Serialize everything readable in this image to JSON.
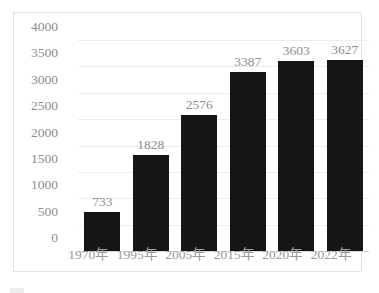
{
  "chart_data": {
    "type": "bar",
    "title": "",
    "subtitle": "",
    "xlabel": "",
    "ylabel": "",
    "categories": [
      "1970年",
      "1995年",
      "2005年",
      "2015年",
      "2020年",
      "2022年"
    ],
    "values": [
      733,
      1828,
      2576,
      3387,
      3603,
      3627
    ],
    "data_labels": [
      "733",
      "1828",
      "2576",
      "3387",
      "3603",
      "3627"
    ],
    "ylim": [
      0,
      4000
    ],
    "yticks": [
      0,
      500,
      1000,
      1500,
      2000,
      2500,
      3000,
      3500,
      4000
    ],
    "ytick_labels": [
      "0",
      "500",
      "1000",
      "1500",
      "2000",
      "2500",
      "3000",
      "3500",
      "4000"
    ],
    "grid": true,
    "grid_axis": "y",
    "legend": false,
    "legend_position": "none",
    "bar_color": "#151515",
    "text_color": "#8d8d8d",
    "grid_color": "#ededed",
    "background_color": "#ffffff",
    "frame_color": "#e3e3e3"
  },
  "figure": {
    "caption_partial": ""
  }
}
